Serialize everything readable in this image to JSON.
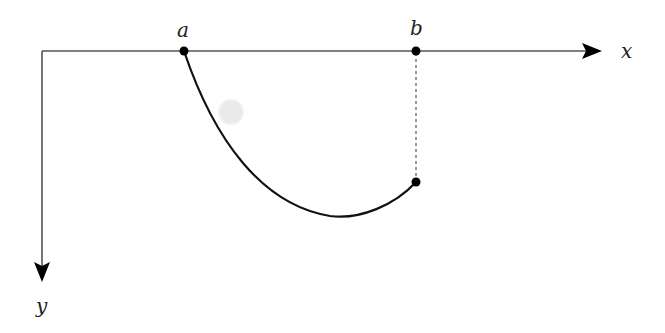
{
  "diagram": {
    "type": "coordinate-sketch",
    "colors": {
      "axis": "#555555",
      "curve": "#111111",
      "point": "#000000",
      "dashed": "#333333",
      "ghost_circle": "#e6e6e6",
      "background": "#ffffff"
    },
    "axes": {
      "x": {
        "label": "x",
        "direction": "right"
      },
      "y": {
        "label": "y",
        "direction": "down"
      }
    },
    "points": [
      {
        "id": "a",
        "label": "a",
        "on": "x-axis"
      },
      {
        "id": "b",
        "label": "b",
        "on": "x-axis"
      },
      {
        "id": "end",
        "label": "",
        "note": "curve endpoint directly below b"
      }
    ],
    "curve": {
      "from": "a",
      "to": "end",
      "shape": "brachistochrone-like arc dipping below endpoint"
    },
    "dashed_line": {
      "from": "b",
      "to": "end"
    }
  }
}
